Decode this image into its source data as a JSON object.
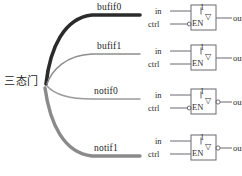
{
  "diagram": {
    "title_cn": "三态门",
    "colors": {
      "curve_dark": "#2b2b2b",
      "curve_mid": "#6f6f6f",
      "curve_light": "#8f8f8f",
      "symbol_stroke": "#6a6a72",
      "wire": "#5a5a60",
      "text": "#232323"
    },
    "branches": [
      {
        "id": "bufif0",
        "label": "bufif0",
        "symbol": {
          "body_label": "1",
          "enable_label": "EN",
          "input_label": "in",
          "control_label": "ctrl",
          "output_label": "out",
          "enable_inverted": true,
          "output_inverted": false,
          "tristate_marker": "▽"
        }
      },
      {
        "id": "bufif1",
        "label": "bufif1",
        "symbol": {
          "body_label": "1",
          "enable_label": "EN",
          "input_label": "in",
          "control_label": "ctrl",
          "output_label": "out",
          "enable_inverted": false,
          "output_inverted": false,
          "tristate_marker": "▽"
        }
      },
      {
        "id": "notif0",
        "label": "notif0",
        "symbol": {
          "body_label": "1",
          "enable_label": "EN",
          "input_label": "in",
          "control_label": "ctrl",
          "output_label": "out",
          "enable_inverted": true,
          "output_inverted": true,
          "tristate_marker": "▽"
        }
      },
      {
        "id": "notif1",
        "label": "notif1",
        "symbol": {
          "body_label": "1",
          "enable_label": "EN",
          "input_label": "in",
          "control_label": "ctrl",
          "output_label": "out",
          "enable_inverted": false,
          "output_inverted": true,
          "tristate_marker": "▽"
        }
      }
    ]
  }
}
